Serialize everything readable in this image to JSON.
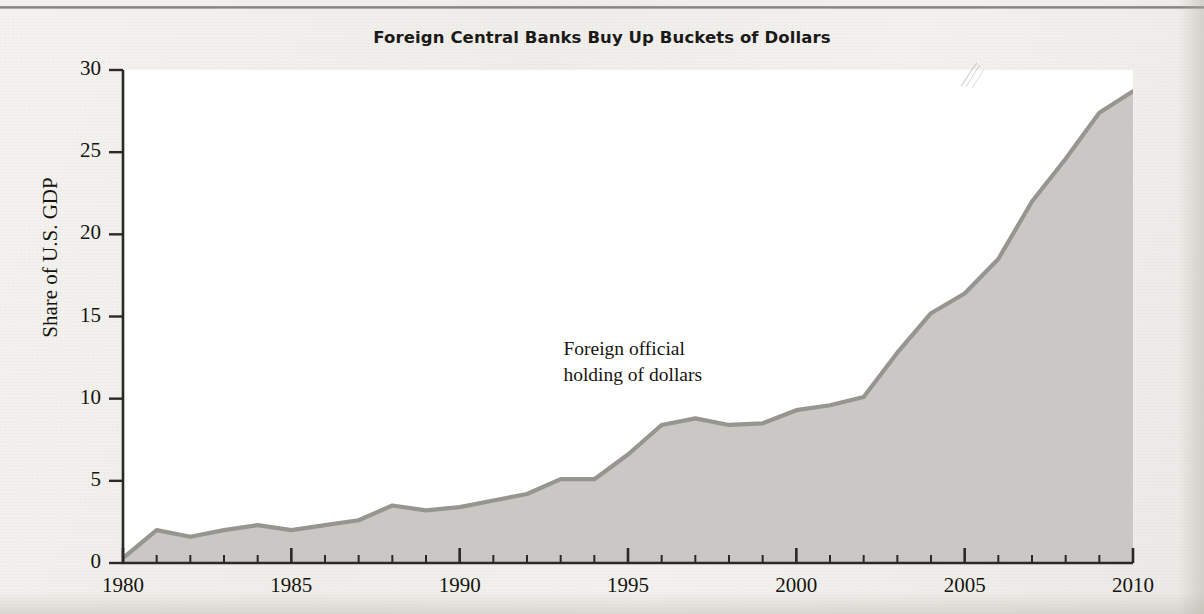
{
  "chart_data": {
    "type": "area",
    "title": "Foreign Central Banks Buy Up Buckets of Dollars",
    "xlabel": "",
    "ylabel": "Share of U.S. GDP",
    "xlim": [
      1980,
      2010
    ],
    "ylim": [
      0,
      30
    ],
    "grid": false,
    "legend_position": "none",
    "annotations": [
      {
        "text": "Foreign official\nholding of dollars",
        "x": 1993.2,
        "y": 12.6
      }
    ],
    "x_ticks": [
      1980,
      1985,
      1990,
      1995,
      2000,
      2005,
      2010
    ],
    "x_tick_labels": [
      "1980",
      "1985",
      "1990",
      "1995",
      "2000",
      "2005",
      "2010"
    ],
    "x_minor_tick_step": 1,
    "y_ticks": [
      0,
      5,
      10,
      15,
      20,
      25,
      30
    ],
    "y_tick_labels": [
      "0",
      "5",
      "10",
      "15",
      "20",
      "25",
      "30"
    ],
    "series": [
      {
        "name": "Foreign official holding of dollars",
        "fill_color": "#c9c8c5",
        "line_color": "#97958f",
        "x": [
          1980,
          1981,
          1982,
          1983,
          1984,
          1985,
          1986,
          1987,
          1988,
          1989,
          1990,
          1991,
          1992,
          1993,
          1994,
          1995,
          1996,
          1997,
          1998,
          1999,
          2000,
          2001,
          2002,
          2003,
          2004,
          2005,
          2006,
          2007,
          2008,
          2009,
          2010
        ],
        "values": [
          0.3,
          2.0,
          1.6,
          2.0,
          2.3,
          2.0,
          2.3,
          2.6,
          3.5,
          3.2,
          3.4,
          3.8,
          4.2,
          5.1,
          5.1,
          6.6,
          8.4,
          8.8,
          8.4,
          8.5,
          9.3,
          9.6,
          10.1,
          12.8,
          15.2,
          16.4,
          18.5,
          22.0,
          24.6,
          27.4,
          28.7
        ]
      }
    ]
  },
  "colors": {
    "paper": "#f2f1ee",
    "plot_background": "#ffffff",
    "axis": "#2a2926",
    "area_fill": "#c9c8c5",
    "area_line": "#97958f",
    "text": "#15140f"
  }
}
